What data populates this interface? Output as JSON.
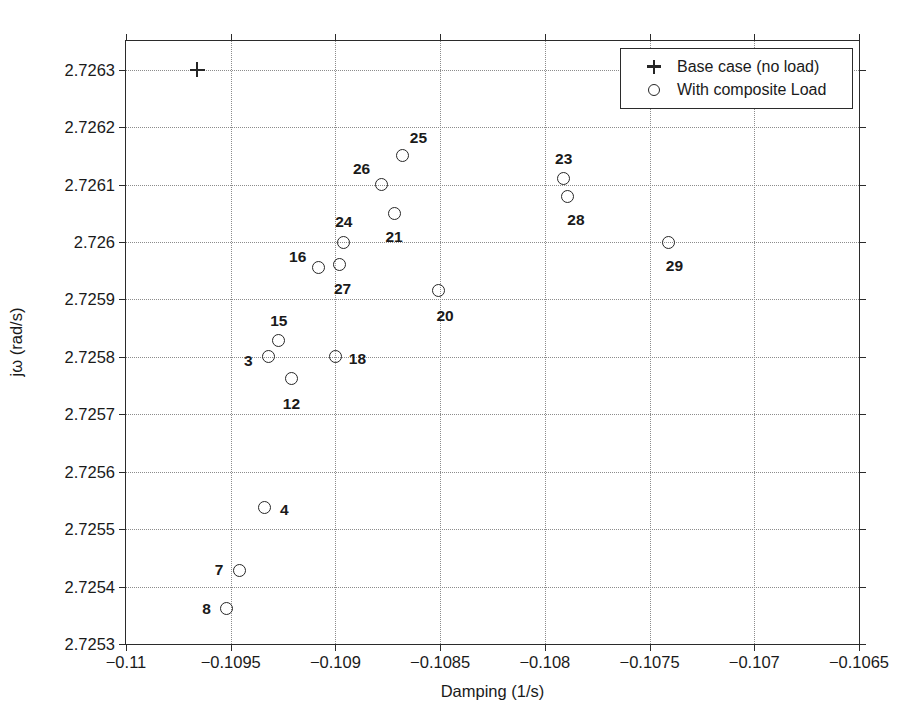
{
  "chart_data": {
    "type": "scatter",
    "title": "",
    "xlabel": "Damping (1/s)",
    "ylabel": "jω (rad/s)",
    "xlim": [
      -0.11,
      -0.1065
    ],
    "ylim": [
      2.7253,
      2.72635
    ],
    "grid": true,
    "legend_position": "top-right",
    "xticks": [
      "-0.11",
      "-0.1095",
      "-0.109",
      "-0.1085",
      "-0.108",
      "-0.1075",
      "-0.107",
      "-0.1065"
    ],
    "xtick_values": [
      -0.11,
      -0.1095,
      -0.109,
      -0.1085,
      -0.108,
      -0.1075,
      -0.107,
      -0.1065
    ],
    "yticks": [
      "2.7253",
      "2.7254",
      "2.7255",
      "2.7256",
      "2.7257",
      "2.7258",
      "2.7259",
      "2.726",
      "2.7261",
      "2.7262",
      "2.7263"
    ],
    "ytick_values": [
      2.7253,
      2.7254,
      2.7255,
      2.7256,
      2.7257,
      2.7258,
      2.7259,
      2.726,
      2.7261,
      2.7262,
      2.7263
    ],
    "series": [
      {
        "name": "Base case (no load)",
        "marker": "plus",
        "points": [
          {
            "label": "",
            "x": -0.10966,
            "y": 2.7263,
            "label_dx": 0,
            "label_dy": 0
          }
        ]
      },
      {
        "name": "With composite Load",
        "marker": "circle",
        "points": [
          {
            "label": "25",
            "x": -0.10868,
            "y": 2.72615,
            "label_dx": 16,
            "label_dy": -18
          },
          {
            "label": "26",
            "x": -0.10878,
            "y": 2.7261,
            "label_dx": -20,
            "label_dy": -16
          },
          {
            "label": "23",
            "x": -0.10791,
            "y": 2.72611,
            "label_dx": 0,
            "label_dy": -20
          },
          {
            "label": "28",
            "x": -0.10789,
            "y": 2.72608,
            "label_dx": 8,
            "label_dy": 24
          },
          {
            "label": "21",
            "x": -0.10872,
            "y": 2.72605,
            "label_dx": 0,
            "label_dy": 24
          },
          {
            "label": "24",
            "x": -0.10896,
            "y": 2.726,
            "label_dx": 0,
            "label_dy": -20
          },
          {
            "label": "29",
            "x": -0.10741,
            "y": 2.726,
            "label_dx": 6,
            "label_dy": 24
          },
          {
            "label": "27",
            "x": -0.10898,
            "y": 2.72596,
            "label_dx": 3,
            "label_dy": 24
          },
          {
            "label": "16",
            "x": -0.10908,
            "y": 2.725955,
            "label_dx": -21,
            "label_dy": -11
          },
          {
            "label": "20",
            "x": -0.10851,
            "y": 2.725915,
            "label_dx": 7,
            "label_dy": 25
          },
          {
            "label": "15",
            "x": -0.10927,
            "y": 2.725828,
            "label_dx": 0,
            "label_dy": -20
          },
          {
            "label": "3",
            "x": -0.10932,
            "y": 2.7258,
            "label_dx": -20,
            "label_dy": 4
          },
          {
            "label": "18",
            "x": -0.109,
            "y": 2.7258,
            "label_dx": 22,
            "label_dy": 2
          },
          {
            "label": "12",
            "x": -0.10921,
            "y": 2.725762,
            "label_dx": 0,
            "label_dy": 25
          },
          {
            "label": "4",
            "x": -0.10934,
            "y": 2.725538,
            "label_dx": 20,
            "label_dy": 3
          },
          {
            "label": "7",
            "x": -0.10946,
            "y": 2.725428,
            "label_dx": -20,
            "label_dy": 0
          },
          {
            "label": "8",
            "x": -0.10952,
            "y": 2.725362,
            "label_dx": -20,
            "label_dy": 1
          }
        ]
      }
    ]
  },
  "legend": {
    "entries": [
      {
        "symbol": "plus-marker",
        "label": "Base case (no load)"
      },
      {
        "symbol": "circle-marker",
        "label": "With composite Load"
      }
    ]
  }
}
